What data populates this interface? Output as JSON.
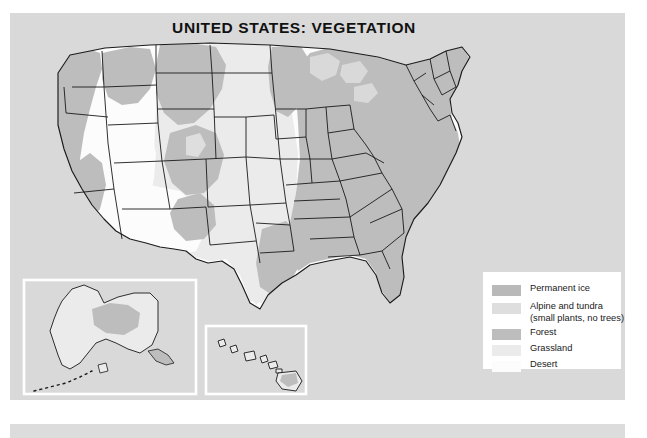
{
  "title": "UNITED STATES: VEGETATION",
  "legend": {
    "items": [
      {
        "label": "Permanent ice",
        "sublabel": "",
        "color": "#b9b9b9"
      },
      {
        "label": "Alpine and tundra",
        "sublabel": "(small plants, no trees)",
        "color": "#dedede"
      },
      {
        "label": "Forest",
        "sublabel": "",
        "color": "#bdbdbd"
      },
      {
        "label": "Grassland",
        "sublabel": "",
        "color": "#ebebeb"
      },
      {
        "label": "Desert",
        "sublabel": "",
        "color": "#fcfcfc"
      }
    ]
  },
  "insets": {
    "alaska": "Alaska",
    "hawaii": "Hawaii"
  },
  "colors": {
    "panel_background": "#d9d9d9",
    "ocean": "#d9d9d9",
    "forest": "#bdbdbd",
    "grassland": "#ebebeb",
    "desert": "#fcfcfc",
    "tundra": "#dedede",
    "ice": "#b9b9b9",
    "outline": "#1a1a1a",
    "inset_border": "#ffffff",
    "title_text": "#111111",
    "legend_background": "#ffffff"
  },
  "map_data": {
    "type": "thematic-choropleth",
    "region": "United States",
    "theme": "Vegetation",
    "classes": [
      "Permanent ice",
      "Alpine and tundra",
      "Forest",
      "Grassland",
      "Desert"
    ],
    "insets": [
      "Alaska",
      "Hawaii"
    ],
    "notes": "Forest dominates the eastern United States, the Pacific Northwest coast and the Rocky Mountain ranges; grassland covers the Great Plains; desert covers the Great Basin and the Southwest."
  }
}
